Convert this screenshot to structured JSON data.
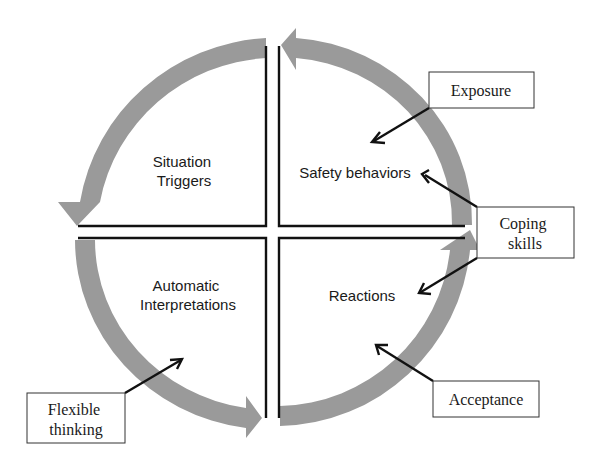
{
  "diagram": {
    "quadrants": {
      "top_left": {
        "line1": "Situation",
        "line2": "Triggers"
      },
      "top_right": {
        "line1": "Safety behaviors"
      },
      "bottom_left": {
        "line1": "Automatic",
        "line2": "Interpretations"
      },
      "bottom_right": {
        "line1": "Reactions"
      }
    },
    "interventions": {
      "exposure": {
        "line1": "Exposure",
        "target": "Safety behaviors"
      },
      "coping": {
        "line1": "Coping",
        "line2": "skills",
        "targets": [
          "Safety behaviors",
          "Reactions"
        ]
      },
      "acceptance": {
        "line1": "Acceptance",
        "target": "Reactions"
      },
      "flexible": {
        "line1": "Flexible",
        "line2": "thinking",
        "target": "Automatic Interpretations"
      }
    },
    "cycle_direction": "counter-clockwise",
    "colors": {
      "arc": "#9a9a9a",
      "lines": "#111111"
    }
  }
}
